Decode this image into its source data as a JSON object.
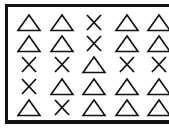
{
  "grid": {
    "rows": 5,
    "cols": 5,
    "cells": [
      [
        "triangle",
        "triangle",
        "cross",
        "triangle",
        "triangle"
      ],
      [
        "triangle",
        "triangle",
        "cross",
        "triangle",
        "triangle"
      ],
      [
        "cross",
        "cross",
        "triangle",
        "cross",
        "cross"
      ],
      [
        "cross",
        "triangle",
        "triangle",
        "triangle",
        "triangle"
      ],
      [
        "triangle",
        "cross",
        "triangle",
        "triangle",
        "triangle"
      ]
    ]
  },
  "colors": {
    "stroke": "#111111",
    "background": "#ffffff"
  }
}
